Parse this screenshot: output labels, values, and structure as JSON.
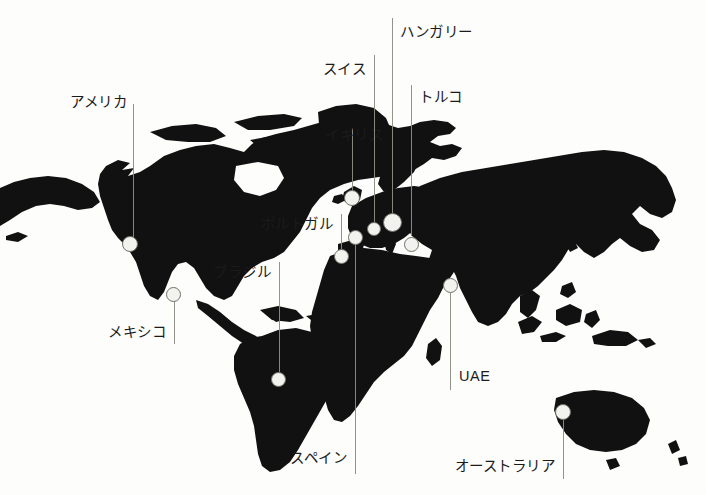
{
  "figure": {
    "type": "annotated-world-map",
    "background_color": "#fdfdfb",
    "land_color": "#111111",
    "marker_fill": "#f2f2ee",
    "marker_stroke": "#70706a",
    "leader_color": "#8d8d86"
  },
  "annotations": [
    {
      "id": "america",
      "label": "アメリカ",
      "label_x": 127,
      "label_y": 102,
      "label_align": "right",
      "line_x": 133,
      "line_top": 104,
      "line_bottom": 238,
      "marker_x": 130,
      "marker_y": 244,
      "marker_r": 8
    },
    {
      "id": "mexico",
      "label": "メキシコ",
      "label_x": 166,
      "label_y": 332,
      "label_align": "right",
      "line_x": 174,
      "line_top": 300,
      "line_bottom": 344,
      "marker_x": 173,
      "marker_y": 294,
      "marker_r": 7.5
    },
    {
      "id": "brazil",
      "label": "ブラジル",
      "label_x": 271,
      "label_y": 272,
      "label_align": "right",
      "line_x": 279,
      "line_top": 262,
      "line_bottom": 372,
      "marker_x": 278,
      "marker_y": 379,
      "marker_r": 7.5
    },
    {
      "id": "portugal",
      "label": "ポルトガル",
      "label_x": 333,
      "label_y": 224,
      "label_align": "right",
      "line_x": 341,
      "line_top": 214,
      "line_bottom": 249,
      "marker_x": 341,
      "marker_y": 256,
      "marker_r": 7.5
    },
    {
      "id": "uk",
      "label": "イギリス",
      "label_x": 325,
      "label_y": 135,
      "label_align": "left",
      "line_x": 352,
      "line_top": 128,
      "line_bottom": 191,
      "marker_x": 352,
      "marker_y": 198,
      "marker_r": 8
    },
    {
      "id": "spain",
      "label": "スペイン",
      "label_x": 347,
      "label_y": 458,
      "label_align": "right",
      "line_x": 355,
      "line_top": 244,
      "line_bottom": 474,
      "marker_x": 355,
      "marker_y": 237,
      "marker_r": 7.5
    },
    {
      "id": "swiss",
      "label": "スイス",
      "label_x": 366,
      "label_y": 69,
      "label_align": "right",
      "line_x": 374,
      "line_top": 55,
      "line_bottom": 222,
      "marker_x": 374,
      "marker_y": 229,
      "marker_r": 7
    },
    {
      "id": "hungary",
      "label": "ハンガリー",
      "label_x": 400,
      "label_y": 32,
      "label_align": "left",
      "line_x": 392,
      "line_top": 18,
      "line_bottom": 213,
      "marker_x": 392,
      "marker_y": 222,
      "marker_r": 9.5
    },
    {
      "id": "turkey",
      "label": "トルコ",
      "label_x": 419,
      "label_y": 97,
      "label_align": "left",
      "line_x": 411,
      "line_top": 85,
      "line_bottom": 236,
      "marker_x": 411,
      "marker_y": 244,
      "marker_r": 7.5
    },
    {
      "id": "uae",
      "label": "UAE",
      "label_x": 459,
      "label_y": 376,
      "label_align": "left",
      "line_x": 450,
      "line_top": 293,
      "line_bottom": 390,
      "marker_x": 450,
      "marker_y": 285,
      "marker_r": 7.5
    },
    {
      "id": "australia",
      "label": "オーストラリア",
      "label_x": 555,
      "label_y": 466,
      "label_align": "right",
      "line_x": 563,
      "line_top": 420,
      "line_bottom": 479,
      "marker_x": 563,
      "marker_y": 412,
      "marker_r": 8
    }
  ]
}
